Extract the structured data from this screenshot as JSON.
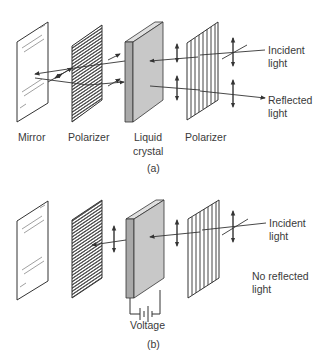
{
  "panel_a": {
    "labels": {
      "mirror": "Mirror",
      "polarizer_left": "Polarizer",
      "liquid_crystal_1": "Liquid",
      "liquid_crystal_2": "crystal",
      "polarizer_right": "Polarizer",
      "incident_1": "Incident",
      "incident_2": "light",
      "reflected_1": "Reflected",
      "reflected_2": "light"
    },
    "caption": "(a)"
  },
  "panel_b": {
    "labels": {
      "voltage": "Voltage",
      "incident_1": "Incident",
      "incident_2": "light",
      "no_reflected_1": "No reflected",
      "no_reflected_2": "light"
    },
    "caption": "(b)"
  },
  "colors": {
    "line": "#333333",
    "crystal_face": "#c8c8c8",
    "crystal_edge": "#a9a9a9"
  }
}
